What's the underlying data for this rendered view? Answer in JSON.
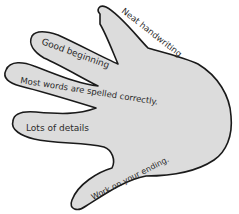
{
  "figure": {
    "type": "hand-shaped feedback graphic",
    "colors": {
      "fill": "#dcdcdc",
      "outline": "#1a1a1a",
      "text": "#2a2a2a"
    },
    "fingers": [
      {
        "label": "Neat handwriting"
      },
      {
        "label": "Good beginning"
      },
      {
        "label": "Most words are spelled correctly."
      },
      {
        "label": "Lots of details"
      },
      {
        "label": "Work on your ending."
      }
    ]
  }
}
